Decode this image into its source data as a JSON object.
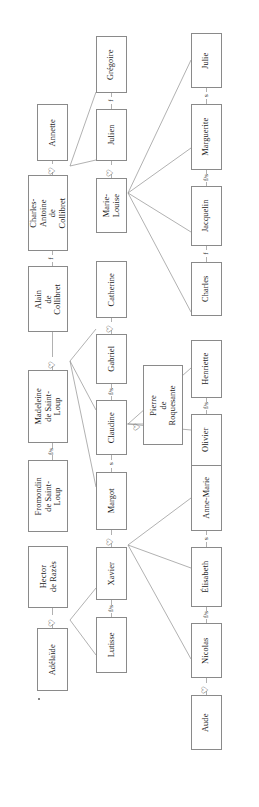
{
  "diagram": {
    "orientation": "rotated-90",
    "symbols": {
      "marriage": "♡",
      "sibling_brother": "f",
      "sibling_sister": "s",
      "sibling_mixed": "f/s"
    }
  },
  "people": {
    "annette": "Annette",
    "charles_antoine": "Charles-Antoine\nde Collibret",
    "gregoire": "Grégoire",
    "julien": "Julien",
    "marie_louise": "Marie-\nLouise",
    "julie": "Julie",
    "marguerite": "Marguerite",
    "jacquelin": "Jacquelin",
    "charles": "Charles",
    "alain": "Alain\nde Collibret",
    "madeleine": "Madeleine\nde Saint-Loup",
    "catherine": "Catherine",
    "gabriel": "Gabriel",
    "claudine": "Claudine",
    "pierre": "Pierre\nde Roquesante",
    "henriette": "Henriette",
    "olivier": "Olivier",
    "fromondin": "Fromondin\nde Saint-Loup",
    "margot": "Margot",
    "hector": "Hector\nde Razès",
    "adelaide": "Adélaïde",
    "xavier": "Xavier",
    "lutisse": "Lutisse",
    "anne_marie": "Anne-Marie",
    "elisabeth": "Élisabeth",
    "nicolas": "Nicolas",
    "aude": "Aude"
  },
  "connectors": {
    "annette_charles_antoine": "♡",
    "gregoire_julien": "f",
    "julien_marie_louise": "♡",
    "julie_marguerite": "s",
    "marguerite_jacquelin": "f/s",
    "jacquelin_charles": "f",
    "charles_antoine_alain": "f",
    "alain_madeleine": "♡",
    "catherine_gabriel": "♡",
    "gabriel_claudine": "f/s",
    "claudine_pierre": "♡",
    "henriette_olivier": "f/s",
    "madeleine_fromondin": "f/s",
    "claudine_margot": "s",
    "margot_xavier": "♡",
    "hector_adelaide": "♡",
    "xavier_lutisse": "f/s",
    "anne_marie_elisabeth": "s",
    "elisabeth_nicolas": "f/s",
    "nicolas_aude": "♡"
  },
  "colors": {
    "box_border": "#8a8a8a",
    "link_line": "#8f8f8f",
    "text": "#1b1b1b",
    "background": "#ffffff"
  }
}
